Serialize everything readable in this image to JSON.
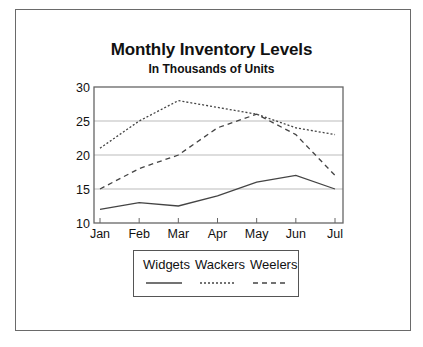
{
  "chart_data": {
    "type": "line",
    "title": "Monthly Inventory Levels",
    "subtitle": "In Thousands of Units",
    "xlabel": "",
    "ylabel": "",
    "categories": [
      "Jan",
      "Feb",
      "Mar",
      "Apr",
      "May",
      "Jun",
      "Jul"
    ],
    "yticks": [
      10,
      15,
      20,
      25,
      30
    ],
    "ylim": [
      10,
      30
    ],
    "grid": "horizontal",
    "legend_position": "bottom",
    "series": [
      {
        "name": "Widgets",
        "style": "solid",
        "values": [
          12,
          13,
          12.5,
          14,
          16,
          17,
          15
        ]
      },
      {
        "name": "Wackers",
        "style": "dotted",
        "values": [
          21,
          25,
          28,
          27,
          26,
          24,
          23
        ]
      },
      {
        "name": "Weelers",
        "style": "dashed",
        "values": [
          15,
          18,
          20,
          24,
          26,
          23,
          17
        ]
      }
    ]
  },
  "colors": {
    "line": "#444444",
    "grid": "#bbbbbb",
    "axis": "#666666"
  }
}
